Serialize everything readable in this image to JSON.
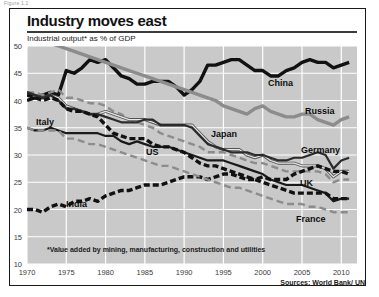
{
  "figure_caption": "Figure 1.1",
  "header": {
    "title": "Industry moves east",
    "subtitle": "Industrial output* as % of GDP"
  },
  "footnote": "*Value added by mining, manufacturing, construction and utilities",
  "sources": "Sources: World Bank/ UN",
  "axis": {
    "y_ticks": [
      "50",
      "45",
      "40",
      "35",
      "30",
      "25",
      "20",
      "15",
      "10"
    ],
    "x_ticks": [
      "1970",
      "1975",
      "1980",
      "1985",
      "1990",
      "1995",
      "2000",
      "2005",
      "2010"
    ]
  },
  "series_labels": {
    "china": "China",
    "russia": "Russia",
    "italy": "Italy",
    "japan": "Japan",
    "germany": "Germany",
    "us": "US",
    "uk": "UK",
    "india": "India",
    "france": "France"
  },
  "chart_data": {
    "type": "line",
    "title": "Industry moves east",
    "subtitle": "Industrial output* as % of GDP",
    "xlabel": "",
    "ylabel": "Industrial output as % of GDP",
    "xlim": [
      1970,
      2012
    ],
    "ylim": [
      10,
      50
    ],
    "y_ticks": [
      10,
      15,
      20,
      25,
      30,
      35,
      40,
      45,
      50
    ],
    "x_ticks": [
      1970,
      1975,
      1980,
      1985,
      1990,
      1995,
      2000,
      2005,
      2010
    ],
    "grid": true,
    "legend": "inline-labels",
    "plot_background": "#c9c9c9",
    "gridline_color": "#ffffff",
    "x": [
      1970,
      1971,
      1972,
      1973,
      1974,
      1975,
      1976,
      1977,
      1978,
      1979,
      1980,
      1981,
      1982,
      1983,
      1984,
      1985,
      1986,
      1987,
      1988,
      1989,
      1990,
      1991,
      1992,
      1993,
      1994,
      1995,
      1996,
      1997,
      1998,
      1999,
      2000,
      2001,
      2002,
      2003,
      2004,
      2005,
      2006,
      2007,
      2008,
      2009,
      2010,
      2011
    ],
    "series": [
      {
        "name": "China",
        "color": "#111111",
        "style": "solid-thick",
        "values": [
          40.0,
          40.5,
          41.0,
          41.5,
          41.0,
          45.5,
          45.0,
          46.0,
          47.5,
          47.0,
          47.5,
          46.0,
          44.5,
          44.0,
          43.0,
          43.0,
          43.5,
          43.5,
          43.5,
          42.5,
          41.0,
          42.0,
          43.5,
          46.5,
          46.5,
          47.0,
          47.5,
          47.5,
          46.5,
          45.5,
          45.5,
          44.5,
          44.5,
          45.5,
          46.0,
          47.0,
          47.5,
          47.0,
          47.0,
          46.0,
          46.5,
          47.0
        ]
      },
      {
        "name": "Russia",
        "color": "#8c8c8c",
        "style": "solid-thick",
        "values": [
          52.0,
          51.5,
          51.0,
          50.5,
          50.0,
          49.5,
          49.0,
          48.5,
          48.0,
          47.5,
          47.0,
          46.5,
          46.0,
          45.5,
          45.0,
          44.5,
          44.0,
          43.5,
          43.0,
          42.5,
          42.0,
          41.5,
          41.0,
          40.5,
          40.0,
          39.0,
          38.5,
          38.0,
          37.5,
          38.5,
          39.0,
          38.0,
          37.5,
          37.0,
          37.0,
          37.5,
          37.5,
          36.5,
          36.0,
          35.5,
          36.5,
          37.0
        ]
      },
      {
        "name": "Italy",
        "color": "#8c8c8c",
        "style": "dashed-medium",
        "values": [
          41.5,
          41.5,
          41.0,
          41.5,
          42.0,
          40.5,
          40.5,
          40.0,
          39.5,
          39.5,
          39.0,
          38.0,
          37.5,
          36.5,
          36.0,
          35.5,
          35.0,
          34.0,
          33.5,
          33.0,
          32.5,
          32.0,
          31.5,
          30.5,
          30.5,
          30.5,
          30.0,
          29.5,
          29.0,
          28.5,
          28.5,
          28.0,
          27.5,
          27.0,
          27.0,
          27.0,
          27.0,
          27.0,
          26.5,
          25.0,
          25.5,
          25.5
        ]
      },
      {
        "name": "Japan",
        "color": "#555555",
        "style": "double-line",
        "values": [
          41.5,
          41.0,
          40.5,
          41.0,
          40.5,
          39.0,
          38.5,
          38.0,
          37.5,
          37.5,
          38.0,
          37.5,
          37.0,
          36.5,
          36.5,
          36.5,
          36.0,
          35.5,
          35.5,
          35.5,
          35.5,
          35.5,
          34.0,
          32.5,
          31.5,
          31.0,
          31.0,
          31.0,
          30.0,
          29.5,
          30.0,
          29.0,
          28.5,
          28.5,
          28.5,
          28.0,
          28.0,
          28.0,
          27.5,
          26.0,
          27.0,
          27.0
        ]
      },
      {
        "name": "Germany",
        "color": "#2b2b2b",
        "style": "solid-medium",
        "values": [
          41.5,
          41.0,
          40.5,
          41.0,
          40.0,
          38.5,
          38.5,
          38.0,
          37.5,
          37.5,
          37.0,
          36.5,
          36.0,
          36.0,
          36.0,
          36.5,
          36.5,
          35.5,
          35.5,
          35.5,
          35.5,
          35.0,
          33.5,
          32.0,
          31.5,
          31.0,
          30.5,
          30.5,
          30.5,
          30.0,
          30.0,
          29.5,
          29.0,
          29.0,
          29.5,
          29.5,
          30.0,
          30.5,
          30.0,
          27.5,
          29.0,
          29.5
        ]
      },
      {
        "name": "US",
        "color": "#1a1a1a",
        "style": "solid-medium",
        "values": [
          35.0,
          34.5,
          34.5,
          35.0,
          34.5,
          34.0,
          34.0,
          34.0,
          34.0,
          34.0,
          33.5,
          33.5,
          32.5,
          32.0,
          32.5,
          32.0,
          31.5,
          31.5,
          31.5,
          31.0,
          30.5,
          30.0,
          29.5,
          29.0,
          29.0,
          29.0,
          28.5,
          28.0,
          27.5,
          27.0,
          26.5,
          25.5,
          25.0,
          24.5,
          24.5,
          24.5,
          24.0,
          23.5,
          23.0,
          21.5,
          22.0,
          22.0
        ]
      },
      {
        "name": "UK",
        "color": "#111111",
        "style": "dashed-thick",
        "values": [
          41.0,
          40.5,
          40.0,
          40.5,
          40.0,
          38.5,
          38.0,
          38.0,
          37.5,
          37.0,
          35.5,
          34.0,
          33.5,
          33.0,
          33.0,
          33.0,
          32.0,
          31.5,
          31.5,
          31.0,
          30.5,
          29.5,
          28.5,
          28.0,
          28.0,
          27.5,
          27.0,
          26.5,
          26.0,
          25.5,
          25.0,
          24.5,
          24.0,
          23.5,
          23.0,
          23.0,
          23.0,
          23.0,
          23.0,
          22.0,
          22.0,
          22.0
        ]
      },
      {
        "name": "India",
        "color": "#111111",
        "style": "dashed-thick",
        "values": [
          20.0,
          20.0,
          19.5,
          20.5,
          21.0,
          20.5,
          21.5,
          21.5,
          22.0,
          21.5,
          22.5,
          23.0,
          23.5,
          23.5,
          24.0,
          24.5,
          24.5,
          24.5,
          25.0,
          25.5,
          26.0,
          26.0,
          26.0,
          25.5,
          26.0,
          26.5,
          26.5,
          26.0,
          25.5,
          25.5,
          26.0,
          25.5,
          25.5,
          25.5,
          26.5,
          27.0,
          27.5,
          28.0,
          27.5,
          27.0,
          27.0,
          26.5
        ]
      },
      {
        "name": "France",
        "color": "#8c8c8c",
        "style": "dashed-medium",
        "values": [
          35.0,
          34.5,
          34.5,
          34.5,
          34.5,
          33.0,
          33.0,
          32.5,
          32.0,
          32.0,
          31.5,
          31.0,
          30.5,
          30.0,
          29.5,
          29.0,
          28.5,
          28.0,
          28.0,
          27.5,
          27.0,
          26.5,
          26.0,
          25.5,
          25.0,
          24.5,
          24.0,
          24.0,
          23.5,
          23.0,
          22.5,
          22.0,
          21.5,
          21.0,
          21.0,
          21.0,
          20.5,
          20.5,
          20.0,
          19.5,
          19.5,
          19.5
        ]
      }
    ]
  }
}
